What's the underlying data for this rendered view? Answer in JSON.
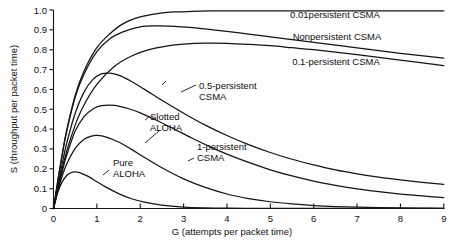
{
  "chart_data": {
    "type": "line",
    "title": "",
    "xlabel": "G (attempts per packet time)",
    "ylabel": "S (throughput per packet time)",
    "xlim": [
      0,
      9
    ],
    "ylim": [
      0,
      1.0
    ],
    "grid": false,
    "legend_position": "inline-annotations",
    "xticks": [
      "0",
      "1",
      "2",
      "3",
      "4",
      "5",
      "6",
      "7",
      "8",
      "9"
    ],
    "yticks": [
      "0",
      "0.1",
      "0.2",
      "0.3",
      "0.4",
      "0.5",
      "0.6",
      "0.7",
      "0.8",
      "0.9",
      "1.0"
    ],
    "series": [
      {
        "name": "0.01persistent CSMA",
        "label_x": 6.0,
        "label_y": 1.0,
        "x": [
          0,
          0.1,
          0.2,
          0.3,
          0.5,
          0.7,
          1.0,
          1.3,
          1.6,
          2.0,
          2.4,
          2.8,
          3.2,
          3.6,
          4.0,
          5.0,
          6.0,
          7.0,
          8.0,
          9.0
        ],
        "y": [
          0,
          0.14,
          0.27,
          0.39,
          0.57,
          0.69,
          0.81,
          0.88,
          0.93,
          0.965,
          0.982,
          0.99,
          0.993,
          0.995,
          0.996,
          0.996,
          0.996,
          0.996,
          0.996,
          0.996
        ]
      },
      {
        "name": "Nonpersistent CSMA",
        "label_x": 6.0,
        "label_y": 0.87,
        "x": [
          0,
          0.1,
          0.2,
          0.3,
          0.5,
          0.7,
          1.0,
          1.3,
          1.6,
          2.0,
          2.4,
          2.8,
          3.2,
          3.6,
          4.0,
          4.5,
          5.0,
          5.5,
          6.0,
          7.0,
          8.0,
          9.0
        ],
        "y": [
          0,
          0.14,
          0.27,
          0.385,
          0.56,
          0.675,
          0.79,
          0.855,
          0.89,
          0.915,
          0.92,
          0.918,
          0.911,
          0.902,
          0.892,
          0.879,
          0.865,
          0.851,
          0.837,
          0.809,
          0.782,
          0.757
        ]
      },
      {
        "name": "0.1-persistent CSMA",
        "label_x": 6.0,
        "label_y": 0.72,
        "x": [
          0,
          0.1,
          0.2,
          0.3,
          0.5,
          0.7,
          1.0,
          1.4,
          1.8,
          2.2,
          2.6,
          3.0,
          3.5,
          4.0,
          4.5,
          5.0,
          5.5,
          6.0,
          7.0,
          8.0,
          9.0
        ],
        "y": [
          0,
          0.105,
          0.2,
          0.285,
          0.42,
          0.52,
          0.625,
          0.715,
          0.768,
          0.8,
          0.818,
          0.828,
          0.833,
          0.832,
          0.827,
          0.82,
          0.81,
          0.8,
          0.775,
          0.748,
          0.72
        ]
      },
      {
        "name": "0.5-persistent CSMA",
        "label_x": 2.35,
        "label_y": 0.62,
        "x": [
          0,
          0.1,
          0.2,
          0.3,
          0.5,
          0.7,
          0.9,
          1.1,
          1.3,
          1.5,
          1.8,
          2.1,
          2.5,
          3.0,
          3.5,
          4.0,
          4.5,
          5.0,
          5.5,
          6.0,
          6.5,
          7.0,
          7.5,
          8.0,
          8.5,
          9.0
        ],
        "y": [
          0,
          0.115,
          0.225,
          0.325,
          0.48,
          0.585,
          0.648,
          0.678,
          0.682,
          0.672,
          0.64,
          0.6,
          0.545,
          0.48,
          0.42,
          0.368,
          0.322,
          0.282,
          0.248,
          0.22,
          0.195,
          0.175,
          0.158,
          0.144,
          0.132,
          0.122
        ]
      },
      {
        "name": "1-persistent CSMA",
        "label_x": 3.15,
        "label_y": 0.345,
        "x": [
          0,
          0.1,
          0.2,
          0.3,
          0.5,
          0.7,
          0.9,
          1.1,
          1.4,
          1.7,
          2.0,
          2.4,
          2.8,
          3.2,
          3.6,
          4.0,
          4.5,
          5.0,
          5.5,
          6.0,
          6.5,
          7.0,
          7.5,
          8.0,
          8.5,
          9.0
        ],
        "y": [
          0,
          0.095,
          0.185,
          0.265,
          0.39,
          0.462,
          0.5,
          0.518,
          0.52,
          0.505,
          0.482,
          0.442,
          0.398,
          0.354,
          0.312,
          0.274,
          0.232,
          0.195,
          0.164,
          0.138,
          0.117,
          0.099,
          0.085,
          0.073,
          0.063,
          0.055
        ]
      },
      {
        "name": "Slotted ALOHA",
        "label_x": 1.75,
        "label_y": 0.435,
        "x": [
          0,
          0.1,
          0.2,
          0.3,
          0.5,
          0.7,
          0.9,
          1.0,
          1.2,
          1.5,
          1.8,
          2.1,
          2.5,
          3.0,
          3.5,
          4.0,
          4.5,
          5.0,
          5.5,
          6.0,
          6.5,
          7.0,
          7.5,
          8.0,
          8.5,
          9.0
        ],
        "y": [
          0,
          0.09,
          0.164,
          0.222,
          0.303,
          0.348,
          0.366,
          0.368,
          0.361,
          0.335,
          0.298,
          0.257,
          0.205,
          0.149,
          0.106,
          0.073,
          0.05,
          0.034,
          0.023,
          0.015,
          0.0098,
          0.0064,
          0.0041,
          0.0027,
          0.0017,
          0.0011
        ]
      },
      {
        "name": "Pure ALOHA",
        "label_x": 1.3,
        "label_y": 0.225,
        "x": [
          0,
          0.1,
          0.2,
          0.3,
          0.4,
          0.5,
          0.6,
          0.8,
          1.0,
          1.2,
          1.5,
          1.8,
          2.1,
          2.5,
          3.0,
          3.5,
          4.0,
          4.5,
          5.0,
          5.5,
          6.0,
          7.0,
          8.0,
          9.0
        ],
        "y": [
          0,
          0.082,
          0.134,
          0.165,
          0.18,
          0.184,
          0.181,
          0.162,
          0.135,
          0.109,
          0.075,
          0.049,
          0.032,
          0.017,
          0.0074,
          0.0032,
          0.0013,
          0.00056,
          0.00023,
          0.0001,
          4e-05,
          7e-06,
          1e-06,
          2e-07
        ]
      }
    ],
    "annotations": [
      {
        "name": "0.01persistent CSMA",
        "text_lines": [
          "0.01persistent CSMA"
        ]
      },
      {
        "name": "Nonpersistent CSMA",
        "text_lines": [
          "Nonpersistent CSMA"
        ]
      },
      {
        "name": "0.1-persistent CSMA",
        "text_lines": [
          "0.1-persistent CSMA"
        ]
      },
      {
        "name": "0.5-persistent CSMA",
        "text_lines": [
          "0.5-persistent",
          "CSMA"
        ]
      },
      {
        "name": "Slotted ALOHA",
        "text_lines": [
          "Slotted",
          "ALOHA"
        ]
      },
      {
        "name": "1-persistent CSMA",
        "text_lines": [
          "1-persistent",
          "CSMA"
        ]
      },
      {
        "name": "Pure ALOHA",
        "text_lines": [
          "Pure",
          "ALOHA"
        ]
      }
    ],
    "colors": {
      "curve": "#141414",
      "axis": "#141414",
      "background": "#fdfdfd"
    }
  },
  "labels": {
    "y_axis_title": "S (throughput per packet time)",
    "x_axis_title": "G (attempts per packet time)",
    "ann_001persistent": "0.01persistent CSMA",
    "ann_nonpersistent": "Nonpersistent CSMA",
    "ann_01persistent": "0.1-persistent CSMA",
    "ann_05persistent_l1": "0.5-persistent",
    "ann_05persistent_l2": "CSMA",
    "ann_slotted_l1": "Slotted",
    "ann_slotted_l2": "ALOHA",
    "ann_1persistent_l1": "1-persistent",
    "ann_1persistent_l2": "CSMA",
    "ann_pure_l1": "Pure",
    "ann_pure_l2": "ALOHA",
    "ytick_0": "0",
    "ytick_01": "0.1",
    "ytick_02": "0.2",
    "ytick_03": "0.3",
    "ytick_04": "0.4",
    "ytick_05": "0.5",
    "ytick_06": "0.6",
    "ytick_07": "0.7",
    "ytick_08": "0.8",
    "ytick_09": "0.9",
    "ytick_10": "1.0",
    "xtick_0": "0",
    "xtick_1": "1",
    "xtick_2": "2",
    "xtick_3": "3",
    "xtick_4": "4",
    "xtick_5": "5",
    "xtick_6": "6",
    "xtick_7": "7",
    "xtick_8": "8",
    "xtick_9": "9"
  }
}
